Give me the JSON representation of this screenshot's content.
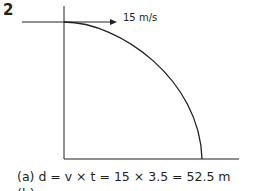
{
  "question": {
    "number": "2"
  },
  "diagram": {
    "velocity_label": "15 m/s",
    "stroke_color": "#231f20"
  },
  "answers": {
    "a": "(a) d = v × t = 15 × 3.5 = 52.5 m",
    "b": "(b)"
  }
}
